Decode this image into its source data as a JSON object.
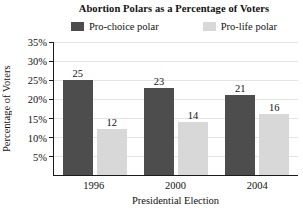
{
  "legend": {
    "items": [
      {
        "label": "Pro-choice polar",
        "color": "#4d4d4d"
      },
      {
        "label": "Pro-life polar",
        "color": "#d8d8d8"
      }
    ]
  },
  "chart_data": {
    "type": "bar",
    "title": "Abortion Polars as a Percentage of Voters",
    "categories": [
      "1996",
      "2000",
      "2004"
    ],
    "series": [
      {
        "name": "Pro-choice polar",
        "color": "#4d4d4d",
        "values": [
          25,
          23,
          21
        ]
      },
      {
        "name": "Pro-life polar",
        "color": "#d8d8d8",
        "values": [
          12,
          14,
          16
        ]
      }
    ],
    "xlabel": "Presidential Election",
    "ylabel": "Percentage of Voters",
    "ylim": [
      0,
      35
    ],
    "yticks": [
      "5%",
      "10%",
      "15%",
      "20%",
      "25%",
      "30%",
      "35%"
    ],
    "grid": true,
    "legend_position": "top",
    "value_labels": true
  },
  "colors": {
    "axis": "#1a1a1a",
    "gridline": "#e4e4e4",
    "text": "#111111",
    "background": "#ffffff"
  }
}
